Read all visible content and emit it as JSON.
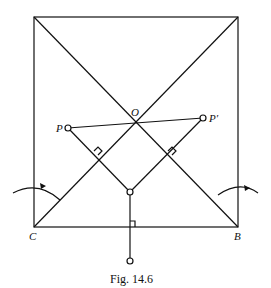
{
  "figure": {
    "caption": "Fig. 14.6",
    "labels": {
      "O": "O",
      "P": "P",
      "P_prime": "P′",
      "C": "C",
      "B": "B"
    }
  }
}
